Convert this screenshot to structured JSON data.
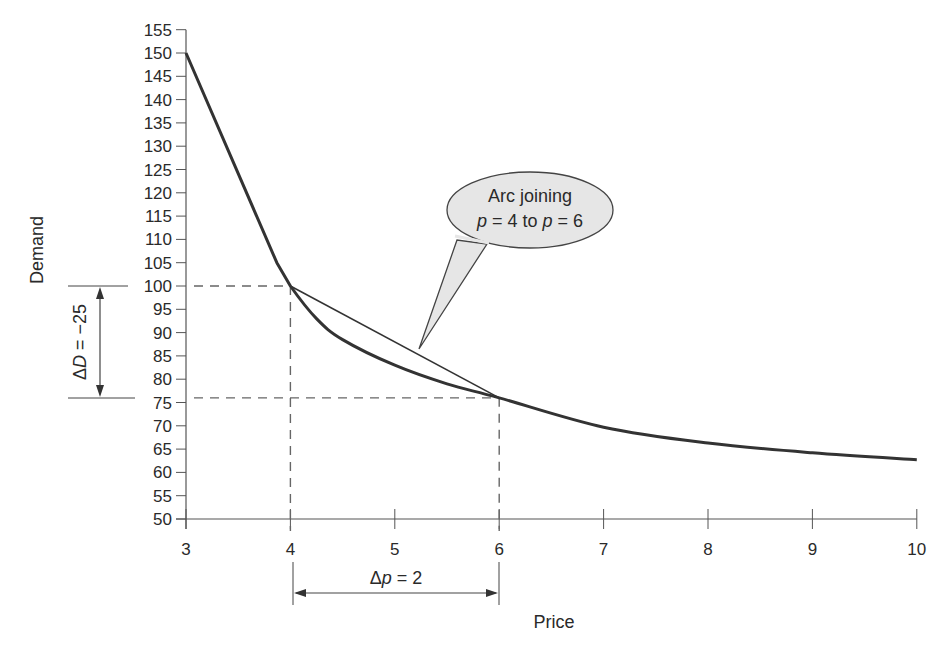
{
  "chart_data": {
    "type": "line",
    "title": "",
    "xlabel": "Price",
    "ylabel": "Demand",
    "xlim": [
      3,
      10
    ],
    "ylim": [
      50,
      155
    ],
    "x_ticks": [
      3,
      4,
      5,
      6,
      7,
      8,
      9,
      10
    ],
    "y_ticks": [
      50,
      55,
      60,
      65,
      70,
      75,
      80,
      85,
      90,
      95,
      100,
      105,
      110,
      115,
      120,
      125,
      130,
      135,
      140,
      145,
      150,
      155
    ],
    "grid": false,
    "series": [
      {
        "name": "Demand curve",
        "x": [
          3,
          3.87,
          4,
          4.25,
          4.5,
          5,
          5.5,
          6,
          7,
          8,
          9,
          10
        ],
        "y": [
          150,
          105,
          100,
          93,
          88.5,
          83,
          79,
          76,
          69.7,
          66.3,
          64.2,
          62.7
        ]
      },
      {
        "name": "Arc (secant) joining p=4 to p=6",
        "x": [
          4,
          6
        ],
        "y": [
          100,
          76
        ]
      }
    ],
    "reference_lines": [
      {
        "type": "horizontal-dashed",
        "y": 100,
        "x_from": 3,
        "x_to": 4
      },
      {
        "type": "horizontal-dashed",
        "y": 76,
        "x_from": 3,
        "x_to": 6
      },
      {
        "type": "vertical-dashed",
        "x": 4,
        "y_from": 50,
        "y_to": 100
      },
      {
        "type": "vertical-dashed",
        "x": 6,
        "y_from": 50,
        "y_to": 76
      }
    ],
    "annotations": [
      {
        "text": "Arc joining p = 4 to p = 6",
        "type": "callout"
      },
      {
        "text": "ΔD = −25",
        "type": "vertical-dimension"
      },
      {
        "text": "Δp = 2",
        "type": "horizontal-dimension"
      }
    ]
  },
  "labels": {
    "xlabel": "Price",
    "ylabel": "Demand",
    "callout_line1": "Arc joining",
    "callout_line2_p1": "p",
    "callout_line2_mid": " = 4 to ",
    "callout_line2_p2": "p",
    "callout_line2_end": " = 6",
    "delta_d_sym": "Δ",
    "delta_d_var": "D",
    "delta_d_val": " = −25",
    "delta_p_sym": "Δ",
    "delta_p_var": "p",
    "delta_p_val": " = 2"
  },
  "colors": {
    "curve": "#333333",
    "axis": "#555555",
    "dashes": "#666666",
    "callout_fill": "#e6e6e6"
  }
}
